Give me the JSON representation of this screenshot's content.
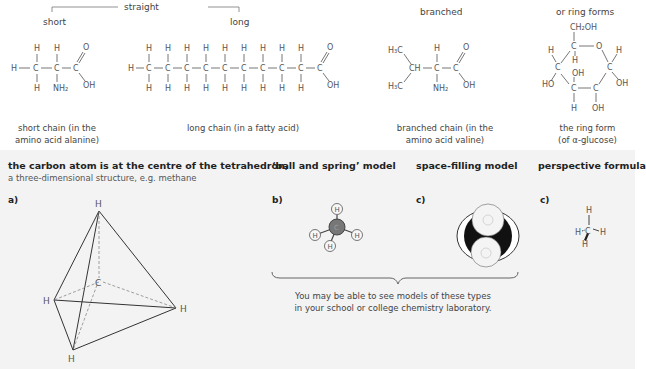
{
  "top": {
    "group_straight": "straight",
    "label_short": "short",
    "label_long": "long",
    "label_branched": "branched",
    "label_ring": "or ring forms",
    "captions": {
      "short": "short chain (in the amino acid alanine)",
      "short_l1": "short chain (in the",
      "short_l2": "amino acid alanine)",
      "long": "long chain (in a fatty acid)",
      "branched_l1": "branched chain (in the",
      "branched_l2": "amino acid valine)",
      "ring_l1": "the ring form",
      "ring_l2": "(of α-glucose)"
    }
  },
  "bottom": {
    "tetra_heading": "the carbon atom is at the centre of the tetrahedron,",
    "tetra_sub": "a three-dimensional structure, e.g. methane",
    "ball_heading": "‘ball and spring’ model",
    "space_heading": "space-filling model",
    "persp_heading": "perspective formula",
    "part_a": "a)",
    "part_b": "b)",
    "part_c1": "c)",
    "part_c2": "c)",
    "note_l1": "You may be able to see models of these types",
    "note_l2": "in your school or college chemistry laboratory."
  },
  "atoms": {
    "H": "H",
    "C": "C",
    "O": "O",
    "OH": "OH",
    "HO": "HO"
  }
}
